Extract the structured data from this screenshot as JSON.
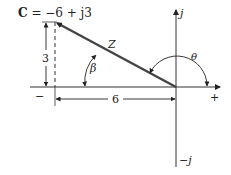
{
  "diagram": {
    "title_bold": "C",
    "title_rest": " = −6 + j3",
    "axis_labels": {
      "positive_imag": "j",
      "negative_imag": "−j",
      "positive_real": "+",
      "negative_real": "−"
    },
    "vector_label": "Z",
    "angle_beta": "β",
    "angle_theta": "θ",
    "dim_vertical": "3",
    "dim_horizontal": "6",
    "point": {
      "real": -6,
      "imag": 3
    },
    "colors": {
      "line": "#333333",
      "vector": "#444444",
      "text": "#222222"
    }
  }
}
